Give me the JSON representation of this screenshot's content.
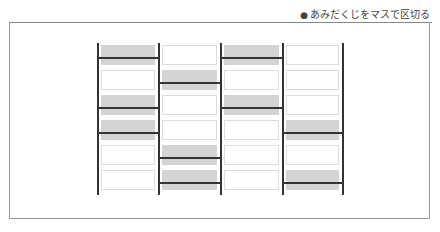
{
  "caption": {
    "bullet": "●",
    "text": "あみだくじをマスで区切る"
  },
  "diagram": {
    "columns": 4,
    "rows": 6,
    "cells": [
      [
        "gray",
        "white",
        "gray",
        "white"
      ],
      [
        "white",
        "gray",
        "white",
        "white"
      ],
      [
        "gray",
        "white",
        "gray",
        "white"
      ],
      [
        "gray",
        "white",
        "white",
        "gray"
      ],
      [
        "white",
        "gray",
        "white",
        "white"
      ],
      [
        "white",
        "gray",
        "white",
        "gray"
      ]
    ],
    "rungs": [
      {
        "col": 0,
        "row": 0
      },
      {
        "col": 0,
        "row": 2
      },
      {
        "col": 0,
        "row": 3
      },
      {
        "col": 1,
        "row": 1
      },
      {
        "col": 1,
        "row": 4
      },
      {
        "col": 1,
        "row": 5
      },
      {
        "col": 2,
        "row": 0
      },
      {
        "col": 2,
        "row": 2
      },
      {
        "col": 3,
        "row": 3
      },
      {
        "col": 3,
        "row": 5
      }
    ],
    "colors": {
      "rail": "#333333",
      "gray_cell": "#d4d4d4",
      "white_cell_border": "#dddddd"
    }
  }
}
